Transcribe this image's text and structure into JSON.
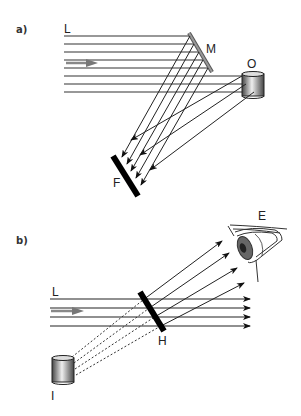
{
  "panel_a": {
    "label": "a)",
    "labels": {
      "light": "L",
      "mirror": "M",
      "object": "O",
      "film": "F"
    }
  },
  "panel_b": {
    "label": "b)",
    "labels": {
      "light": "L",
      "hologram": "H",
      "eye": "E",
      "image": "I"
    }
  },
  "colors": {
    "line": "#222222",
    "element": "#111111",
    "mirror": "#777777"
  }
}
